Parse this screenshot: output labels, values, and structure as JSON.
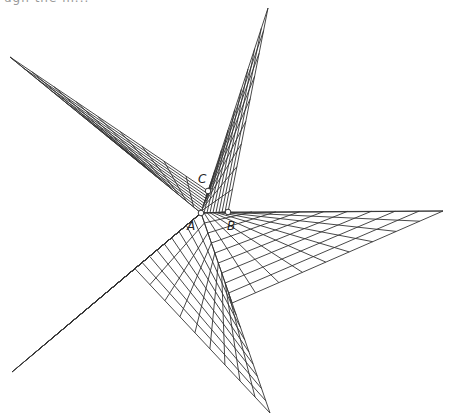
{
  "header": {
    "cut_text": "ugh the m..."
  },
  "figure": {
    "type": "string-art star net",
    "line_color": "#333333",
    "point_fill": "#ffffff",
    "grid_lines_per_family": 9,
    "points": [
      {
        "name": "A",
        "label": "A"
      },
      {
        "name": "B",
        "label": "B"
      },
      {
        "name": "C",
        "label": "C"
      }
    ]
  }
}
